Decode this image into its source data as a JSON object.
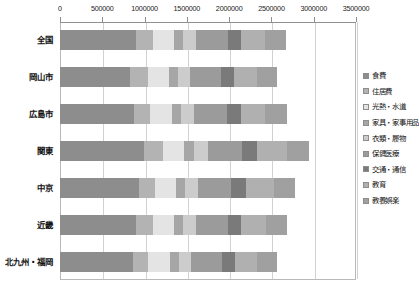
{
  "chart_data": {
    "type": "bar",
    "orientation": "horizontal",
    "stacked": true,
    "title": "",
    "xlabel": "",
    "ylabel": "",
    "xlim": [
      0,
      3500000
    ],
    "xticks": [
      0,
      500000,
      1000000,
      1500000,
      2000000,
      2500000,
      3000000,
      3500000
    ],
    "xtick_labels": [
      "0",
      "500000",
      "1000000",
      "1500000",
      "2000000",
      "2500000",
      "3000000",
      "3500000"
    ],
    "grid": true,
    "legend_position": "right",
    "categories": [
      "全国",
      "岡山市",
      "広島市",
      "関東",
      "中京",
      "近畿",
      "北九州・福岡"
    ],
    "series": [
      {
        "name": "食費",
        "color": "#8d8d8d",
        "values": [
          900000,
          830000,
          880000,
          990000,
          930000,
          900000,
          860000
        ]
      },
      {
        "name": "住居費",
        "color": "#b3b3b3",
        "values": [
          200000,
          210000,
          180000,
          230000,
          190000,
          195000,
          185000
        ]
      },
      {
        "name": "光熱・水道",
        "color": "#e4e4e4",
        "values": [
          250000,
          250000,
          260000,
          245000,
          250000,
          255000,
          260000
        ]
      },
      {
        "name": "家具・家事用品",
        "color": "#a6a6a6",
        "values": [
          105000,
          100000,
          110000,
          115000,
          105000,
          105000,
          100000
        ]
      },
      {
        "name": "衣類・履物",
        "color": "#cccccc",
        "values": [
          150000,
          145000,
          155000,
          170000,
          160000,
          150000,
          145000
        ]
      },
      {
        "name": "保健医療",
        "color": "#9b9b9b",
        "values": [
          380000,
          370000,
          385000,
          400000,
          390000,
          380000,
          370000
        ]
      },
      {
        "name": "交通・通信",
        "color": "#7a7a7a",
        "values": [
          160000,
          155000,
          165000,
          175000,
          170000,
          160000,
          155000
        ]
      },
      {
        "name": "教育",
        "color": "#b0b0b0",
        "values": [
          280000,
          270000,
          290000,
          360000,
          330000,
          290000,
          250000
        ]
      },
      {
        "name": "教養娯楽",
        "color": "#a0a0a0",
        "values": [
          250000,
          240000,
          255000,
          265000,
          250000,
          245000,
          240000
        ]
      }
    ]
  }
}
